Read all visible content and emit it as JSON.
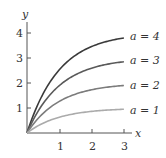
{
  "chart_data": {
    "type": "line",
    "title": "",
    "xlabel": "x",
    "ylabel": "y",
    "xlim": [
      0,
      3.1
    ],
    "ylim": [
      0,
      4.4
    ],
    "x_ticks": [
      "1",
      "2",
      "3"
    ],
    "y_ticks": [
      "1",
      "2",
      "3",
      "4"
    ],
    "grid": false,
    "legend_position": "inline-right",
    "x": [
      0,
      0.25,
      0.5,
      0.75,
      1.0,
      1.25,
      1.5,
      1.75,
      2.0,
      2.25,
      2.5,
      2.75,
      3.0
    ],
    "series": [
      {
        "name": "a = 4",
        "a": 4,
        "color": "#3a3a3a",
        "values": [
          0,
          0.885,
          1.574,
          2.111,
          2.528,
          2.854,
          3.107,
          3.305,
          3.459,
          3.579,
          3.672,
          3.744,
          3.801
        ]
      },
      {
        "name": "a = 3",
        "a": 3,
        "color": "#5a5a5a",
        "values": [
          0,
          0.664,
          1.18,
          1.583,
          1.896,
          2.14,
          2.331,
          2.479,
          2.594,
          2.684,
          2.754,
          2.808,
          2.851
        ]
      },
      {
        "name": "a = 2",
        "a": 2,
        "color": "#7c7c7c",
        "values": [
          0,
          0.442,
          0.787,
          1.055,
          1.264,
          1.427,
          1.554,
          1.652,
          1.729,
          1.789,
          1.836,
          1.872,
          1.9
        ]
      },
      {
        "name": "a = 1",
        "a": 1,
        "color": "#ababab",
        "values": [
          0,
          0.221,
          0.393,
          0.528,
          0.632,
          0.713,
          0.777,
          0.826,
          0.865,
          0.895,
          0.918,
          0.936,
          0.95
        ]
      }
    ]
  },
  "axes": {
    "x_label": "x",
    "y_label": "y",
    "x_tick_labels": [
      "1",
      "2",
      "3"
    ],
    "y_tick_labels": [
      "1",
      "2",
      "3",
      "4"
    ]
  },
  "legend": [
    "a = 4",
    "a = 3",
    "a = 2",
    "a = 1"
  ]
}
